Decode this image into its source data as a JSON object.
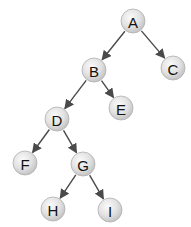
{
  "diagram": {
    "type": "binary-tree",
    "colors": {
      "edge": "#4a4a4a",
      "node_fill_center": "#fafafa",
      "node_fill_edge": "#c4c4c4",
      "node_stroke": "#b0b0b0",
      "label": "#111111",
      "background": "#ffffff"
    },
    "node_radius": 12,
    "nodes": [
      {
        "id": "A",
        "label": "A",
        "x": 133,
        "y": 21
      },
      {
        "id": "B",
        "label": "B",
        "x": 94,
        "y": 70
      },
      {
        "id": "C",
        "label": "C",
        "x": 173,
        "y": 68
      },
      {
        "id": "D",
        "label": "D",
        "x": 57,
        "y": 119
      },
      {
        "id": "E",
        "label": "E",
        "x": 121,
        "y": 108
      },
      {
        "id": "F",
        "label": "F",
        "x": 25,
        "y": 163
      },
      {
        "id": "G",
        "label": "G",
        "x": 83,
        "y": 164
      },
      {
        "id": "H",
        "label": "H",
        "x": 53,
        "y": 209
      },
      {
        "id": "I",
        "label": "I",
        "x": 110,
        "y": 210
      }
    ],
    "edges": [
      {
        "from": "A",
        "to": "B"
      },
      {
        "from": "A",
        "to": "C"
      },
      {
        "from": "B",
        "to": "D"
      },
      {
        "from": "B",
        "to": "E"
      },
      {
        "from": "D",
        "to": "F"
      },
      {
        "from": "D",
        "to": "G"
      },
      {
        "from": "G",
        "to": "H"
      },
      {
        "from": "G",
        "to": "I"
      }
    ]
  }
}
